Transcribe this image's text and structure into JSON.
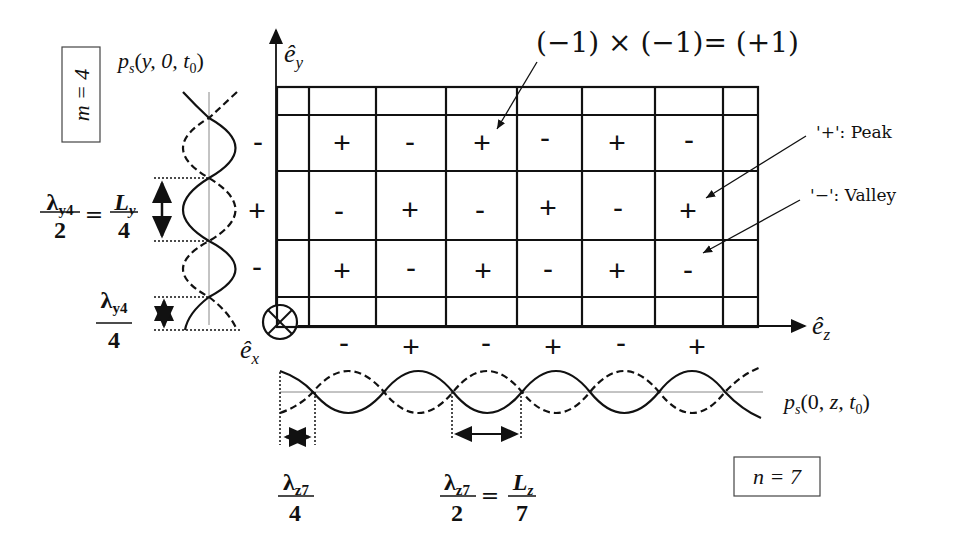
{
  "diagram": {
    "m_label": "m = 4",
    "n_label": "n = 7",
    "axes": {
      "y_axis": "ê_y",
      "z_axis": "ê_z",
      "x_axis": "ê_x (into page)"
    },
    "y_wave_label": "p_s(y, 0, t_0)",
    "z_wave_label": "p_s(0, z, t_0)",
    "product_annotation": "(−1) × (−1)= (+1)",
    "legend": {
      "peak": "'+': Peak",
      "valley": "'−': Valley"
    },
    "y_signs": [
      "-",
      "+",
      "-"
    ],
    "z_signs": [
      "-",
      "+",
      "-",
      "+",
      "-",
      "+"
    ],
    "grid_signs": [
      [
        "+",
        "-",
        "+",
        "-",
        "+",
        "-"
      ],
      [
        "-",
        "+",
        "-",
        "+",
        "-",
        "+"
      ],
      [
        "+",
        "-",
        "+",
        "-",
        "+",
        "-"
      ]
    ],
    "formulas": {
      "y_half": {
        "num": "λ_y4",
        "den": "2",
        "eq_num": "L_y",
        "eq_den": "4"
      },
      "y_quarter": {
        "num": "λ_y4",
        "den": "4"
      },
      "z_quarter": {
        "num": "λ_z7",
        "den": "4"
      },
      "z_half": {
        "num": "λ_z7",
        "den": "2",
        "eq_num": "L_z",
        "eq_den": "7"
      }
    },
    "colors": {
      "line": "#111111",
      "thin_line": "#777777",
      "background": "#ffffff"
    }
  }
}
